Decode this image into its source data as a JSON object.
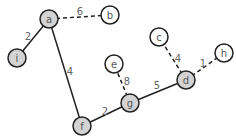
{
  "diagram": {
    "type": "weighted-graph",
    "colors": {
      "visited_fill": "#d3d3d3",
      "unvisited_fill": "#ffffff",
      "stroke": "#222222",
      "label": "#555555"
    },
    "nodes": [
      {
        "id": "a",
        "label": "a",
        "x": 49,
        "y": 19,
        "visited": true
      },
      {
        "id": "b",
        "label": "b",
        "x": 110,
        "y": 15,
        "visited": false
      },
      {
        "id": "i",
        "label": "i",
        "x": 17,
        "y": 58,
        "visited": true
      },
      {
        "id": "c",
        "label": "c",
        "x": 159,
        "y": 37,
        "visited": false
      },
      {
        "id": "h",
        "label": "h",
        "x": 224,
        "y": 53,
        "visited": false
      },
      {
        "id": "e",
        "label": "e",
        "x": 114,
        "y": 64,
        "visited": false
      },
      {
        "id": "d",
        "label": "d",
        "x": 186,
        "y": 80,
        "visited": true
      },
      {
        "id": "g",
        "label": "g",
        "x": 130,
        "y": 103,
        "visited": true
      },
      {
        "id": "f",
        "label": "f",
        "x": 82,
        "y": 126,
        "visited": true
      }
    ],
    "edges": [
      {
        "from": "a",
        "to": "b",
        "weight": "6",
        "style": "dashed",
        "lx": 80,
        "ly": 12
      },
      {
        "from": "a",
        "to": "i",
        "weight": "2",
        "style": "solid",
        "lx": 28,
        "ly": 37
      },
      {
        "from": "a",
        "to": "f",
        "weight": "4",
        "style": "solid",
        "lx": 70,
        "ly": 72
      },
      {
        "from": "f",
        "to": "g",
        "weight": "2",
        "style": "solid",
        "lx": 105,
        "ly": 112
      },
      {
        "from": "g",
        "to": "e",
        "weight": "8",
        "style": "dashed",
        "lx": 127,
        "ly": 82
      },
      {
        "from": "g",
        "to": "d",
        "weight": "5",
        "style": "solid",
        "lx": 157,
        "ly": 86
      },
      {
        "from": "d",
        "to": "c",
        "weight": "4",
        "style": "dashed",
        "lx": 178,
        "ly": 59
      },
      {
        "from": "d",
        "to": "h",
        "weight": "1",
        "style": "dashed",
        "lx": 203,
        "ly": 64
      }
    ]
  }
}
